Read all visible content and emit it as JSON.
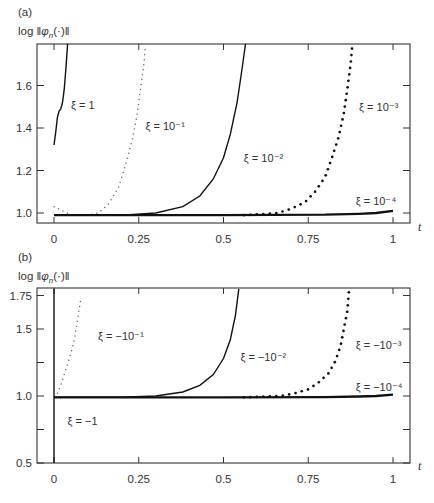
{
  "chart_data": [
    {
      "panel": "(a)",
      "type": "line",
      "title": "",
      "xlabel": "t",
      "ylabel": "log ‖φ_n(·)‖",
      "xlim": [
        -0.05,
        1.05
      ],
      "ylim": [
        0.95,
        1.8
      ],
      "xticks": [
        0,
        0.25,
        0.5,
        0.75,
        1
      ],
      "xtick_labels": [
        "0",
        "0.25",
        "0.5",
        "0.75",
        "1"
      ],
      "yticks": [
        1.0,
        1.2,
        1.4,
        1.6
      ],
      "ytick_labels": [
        "1.0",
        "1.2",
        "1.4",
        "1.6"
      ],
      "grid": false,
      "series": [
        {
          "name": "ξ = 1",
          "style": "solid",
          "x": [
            0.0,
            0.005,
            0.01,
            0.015,
            0.02,
            0.025,
            0.03,
            0.035,
            0.04
          ],
          "y": [
            1.32,
            1.38,
            1.45,
            1.48,
            1.49,
            1.52,
            1.58,
            1.68,
            1.8
          ]
        },
        {
          "name": "ξ = 10⁻¹",
          "style": "fine-dotted",
          "x": [
            0.0,
            0.05,
            0.1,
            0.13,
            0.16,
            0.19,
            0.21,
            0.23,
            0.245,
            0.255,
            0.265,
            0.27
          ],
          "y": [
            1.03,
            0.99,
            0.99,
            1.0,
            1.04,
            1.12,
            1.22,
            1.34,
            1.46,
            1.58,
            1.7,
            1.79
          ]
        },
        {
          "name": "ξ = 10⁻²",
          "style": "solid",
          "x": [
            0.0,
            0.2,
            0.3,
            0.38,
            0.43,
            0.47,
            0.5,
            0.52,
            0.54,
            0.555,
            0.565
          ],
          "y": [
            0.99,
            0.99,
            1.0,
            1.03,
            1.08,
            1.16,
            1.26,
            1.37,
            1.52,
            1.68,
            1.8
          ]
        },
        {
          "name": "ξ = 10⁻³",
          "style": "bold-dotted",
          "x": [
            0.56,
            0.62,
            0.66,
            0.7,
            0.74,
            0.77,
            0.8,
            0.82,
            0.84,
            0.855,
            0.865,
            0.875,
            0.88
          ],
          "y": [
            0.99,
            0.995,
            1.0,
            1.02,
            1.05,
            1.1,
            1.17,
            1.26,
            1.36,
            1.47,
            1.58,
            1.7,
            1.79
          ]
        },
        {
          "name": "ξ = 10⁻⁴",
          "style": "thick-solid",
          "x": [
            0.0,
            0.5,
            0.8,
            0.9,
            0.95,
            1.0
          ],
          "y": [
            0.99,
            0.99,
            0.992,
            0.996,
            1.0,
            1.01
          ]
        }
      ],
      "annotations": [
        {
          "text": "ξ = 1",
          "x": 0.05,
          "y": 1.49
        },
        {
          "text": "ξ = 10⁻¹",
          "x": 0.27,
          "y": 1.39
        },
        {
          "text": "ξ = 10⁻²",
          "x": 0.56,
          "y": 1.24
        },
        {
          "text": "ξ = 10⁻³",
          "x": 0.9,
          "y": 1.48
        },
        {
          "text": "ξ = 10⁻⁴",
          "x": 0.89,
          "y": 1.04
        }
      ]
    },
    {
      "panel": "(b)",
      "type": "line",
      "title": "",
      "xlabel": "t",
      "ylabel": "log ‖φ_n(·)‖",
      "xlim": [
        -0.05,
        1.05
      ],
      "ylim": [
        0.5,
        1.8
      ],
      "xticks": [
        0,
        0.25,
        0.5,
        0.75,
        1
      ],
      "xtick_labels": [
        "0",
        "0.25",
        "0.5",
        "0.75",
        "1"
      ],
      "yticks": [
        0.5,
        0.75,
        1.0,
        1.25,
        1.5,
        1.75
      ],
      "ytick_labels": [
        "0.5",
        "",
        "1.0",
        "",
        "1.5",
        "1.75"
      ],
      "grid": false,
      "series": [
        {
          "name": "ξ = −1",
          "style": "solid",
          "x": [
            0.0,
            0.0,
            0.0
          ],
          "y": [
            0.5,
            1.0,
            1.8
          ]
        },
        {
          "name": "ξ = −10⁻¹",
          "style": "fine-dotted",
          "x": [
            0.01,
            0.02,
            0.03,
            0.04,
            0.05,
            0.06,
            0.065,
            0.07,
            0.075,
            0.08
          ],
          "y": [
            1.02,
            1.08,
            1.16,
            1.24,
            1.32,
            1.42,
            1.5,
            1.58,
            1.66,
            1.74
          ]
        },
        {
          "name": "ξ = −10⁻²",
          "style": "solid",
          "x": [
            0.0,
            0.2,
            0.3,
            0.38,
            0.43,
            0.47,
            0.5,
            0.52,
            0.535,
            0.545
          ],
          "y": [
            0.99,
            0.99,
            1.0,
            1.03,
            1.08,
            1.16,
            1.28,
            1.42,
            1.6,
            1.8
          ]
        },
        {
          "name": "ξ = −10⁻³",
          "style": "bold-dotted",
          "x": [
            0.56,
            0.62,
            0.67,
            0.71,
            0.75,
            0.78,
            0.81,
            0.83,
            0.845,
            0.855,
            0.865,
            0.87
          ],
          "y": [
            0.99,
            0.995,
            1.0,
            1.02,
            1.05,
            1.1,
            1.17,
            1.26,
            1.37,
            1.5,
            1.63,
            1.78
          ]
        },
        {
          "name": "ξ = −10⁻⁴",
          "style": "thick-solid",
          "x": [
            0.0,
            0.5,
            0.8,
            0.9,
            0.95,
            1.0
          ],
          "y": [
            0.99,
            0.99,
            0.992,
            0.996,
            1.0,
            1.01
          ]
        }
      ],
      "annotations": [
        {
          "text": "ξ = −1",
          "x": 0.04,
          "y": 0.78
        },
        {
          "text": "ξ = −10⁻¹",
          "x": 0.13,
          "y": 1.42
        },
        {
          "text": "ξ = −10⁻²",
          "x": 0.55,
          "y": 1.26
        },
        {
          "text": "ξ = −10⁻³",
          "x": 0.89,
          "y": 1.35
        },
        {
          "text": "ξ = −10⁻⁴",
          "x": 0.89,
          "y": 1.04
        }
      ]
    }
  ],
  "panels": {
    "a": {
      "label": "(a)",
      "ylabel_prefix": "log ‖",
      "ylabel_phi": "φ",
      "ylabel_sub": "n",
      "ylabel_suffix": "(·)‖",
      "xlabel": "t"
    },
    "b": {
      "label": "(b)",
      "ylabel_prefix": "log ‖",
      "ylabel_phi": "φ",
      "ylabel_sub": "n",
      "ylabel_suffix": "(·)‖",
      "xlabel": "t"
    }
  },
  "colors": {
    "ink": "#111111",
    "frame": "#333333",
    "fine_dots": "#666666",
    "background": "#ffffff"
  }
}
